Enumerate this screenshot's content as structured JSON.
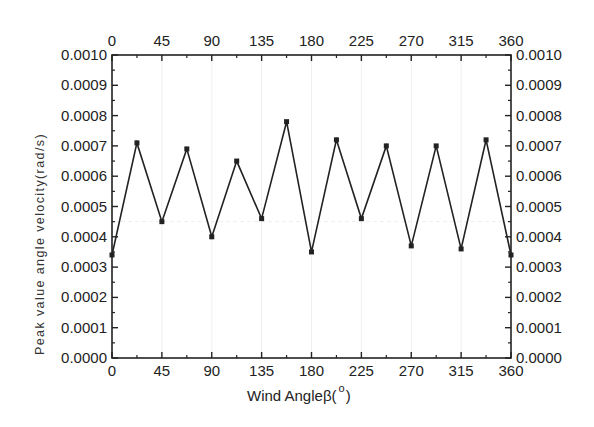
{
  "chart_data": {
    "type": "line",
    "title": "",
    "xlabel": "Wind Angleβ(°)",
    "xlabel_main": "Wind Angleβ(",
    "xlabel_degree": "o",
    "xlabel_close": ")",
    "ylabel": "Peak value angle velocity(rad/s)",
    "xlim": [
      0,
      360
    ],
    "ylim": [
      0,
      0.001
    ],
    "x_ticks": [
      "0",
      "45",
      "90",
      "135",
      "180",
      "225",
      "270",
      "315",
      "360"
    ],
    "y_ticks": [
      "0.0000",
      "0.0001",
      "0.0002",
      "0.0003",
      "0.0004",
      "0.0005",
      "0.0006",
      "0.0007",
      "0.0008",
      "0.0009",
      "0.0010"
    ],
    "top_axis_mirrored": true,
    "right_axis_mirrored": true,
    "marker": "square",
    "grid": false,
    "series": [
      {
        "name": "Peak value angle velocity",
        "x": [
          0,
          22.5,
          45,
          67.5,
          90,
          112.5,
          135,
          157.5,
          180,
          202.5,
          225,
          247.5,
          270,
          292.5,
          315,
          337.5,
          360
        ],
        "values": [
          0.00034,
          0.00071,
          0.00045,
          0.00069,
          0.0004,
          0.00065,
          0.00046,
          0.00078,
          0.00035,
          0.00072,
          0.00046,
          0.0007,
          0.00037,
          0.0007,
          0.00036,
          0.00072,
          0.00034
        ]
      }
    ]
  },
  "colors": {
    "line": "#222222",
    "axis": "#222222",
    "background": "#ffffff"
  }
}
